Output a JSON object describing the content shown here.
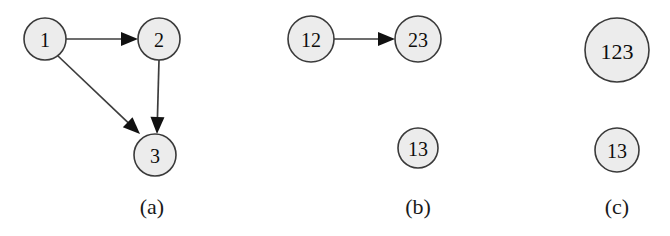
{
  "figure": {
    "width": 670,
    "height": 236,
    "background": "#ffffff",
    "node_fill": "#ececec",
    "node_stroke": "#3a3a3a",
    "edge_color": "#3d3d3d",
    "label_color": "#0d0d0d"
  },
  "panels": [
    {
      "id": "a",
      "caption": "(a)",
      "caption_x": 152,
      "caption_y": 206,
      "nodes": [
        {
          "id": "a1",
          "label": "1",
          "cx": 45,
          "cy": 39,
          "r": 21
        },
        {
          "id": "a2",
          "label": "2",
          "cx": 159,
          "cy": 39,
          "r": 21
        },
        {
          "id": "a3",
          "label": "3",
          "cx": 155,
          "cy": 155,
          "r": 21
        }
      ],
      "edges": [
        {
          "id": "a-1-2",
          "from": "a1",
          "to": "a2",
          "x1": 66,
          "y1": 39,
          "x2": 138,
          "y2": 39
        },
        {
          "id": "a-1-3",
          "from": "a1",
          "to": "a3",
          "x1": 58,
          "y1": 56,
          "x2": 140,
          "y2": 134
        },
        {
          "id": "a-2-3",
          "from": "a2",
          "to": "a3",
          "x1": 159,
          "y1": 60,
          "x2": 157,
          "y2": 134
        }
      ]
    },
    {
      "id": "b",
      "caption": "(b)",
      "caption_x": 418,
      "caption_y": 206,
      "nodes": [
        {
          "id": "b12",
          "label": "12",
          "cx": 311,
          "cy": 39,
          "r": 23
        },
        {
          "id": "b23",
          "label": "23",
          "cx": 418,
          "cy": 39,
          "r": 23
        },
        {
          "id": "b13",
          "label": "13",
          "cx": 418,
          "cy": 148,
          "r": 20
        }
      ],
      "edges": [
        {
          "id": "b-12-23",
          "from": "b12",
          "to": "b23",
          "x1": 334,
          "y1": 39,
          "x2": 395,
          "y2": 39
        }
      ]
    },
    {
      "id": "c",
      "caption": "(c)",
      "caption_x": 617,
      "caption_y": 206,
      "nodes": [
        {
          "id": "c123",
          "label": "123",
          "cx": 617,
          "cy": 50,
          "r": 32
        },
        {
          "id": "c13",
          "label": "13",
          "cx": 617,
          "cy": 150,
          "r": 22
        }
      ],
      "edges": []
    }
  ]
}
